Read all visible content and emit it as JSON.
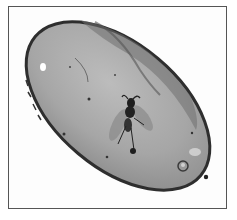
{
  "image": {
    "subject": "insect-in-amber",
    "description": "Grayscale photograph of a polished oval piece of amber containing a winged insect (fly/gnat), inside a thin rectangular frame",
    "colors": {
      "background": "#ffffff",
      "frame_border": "#555555",
      "amber_fill": "#a9a9a9",
      "amber_edge": "#2e2e2e",
      "insect": "#1e1e1e"
    }
  }
}
